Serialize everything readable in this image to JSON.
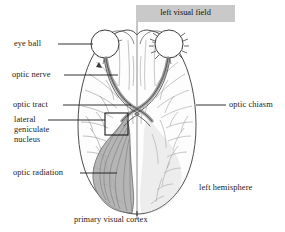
{
  "figure": {
    "background_color": "#ffffff",
    "ink_color": "#333333",
    "shade_color": "#a6a6a6",
    "banner_color": "#c9c9c9"
  },
  "banner": {
    "label": "left visual field"
  },
  "labels": {
    "eye_ball": "eye ball",
    "optic_nerve": "optic nerve",
    "optic_tract": "optic tract",
    "lgn_line1": "lateral",
    "lgn_line2": "geniculate",
    "lgn_line3": "nucleus",
    "optic_radiation": "optic radiation",
    "optic_chiasm": "optic chiasm",
    "left_hemisphere": "left hemisphere",
    "primary_visual_cortex": "primary visual cortex"
  },
  "icons": {
    "leader_line": "leader-line",
    "midline": "vertical-midline",
    "lgn_box": "highlight-rectangle"
  }
}
